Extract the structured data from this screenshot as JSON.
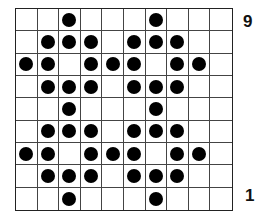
{
  "board": {
    "rows": 9,
    "cols": 10,
    "grid": [
      [
        0,
        0,
        1,
        0,
        0,
        0,
        1,
        0,
        0,
        0
      ],
      [
        0,
        1,
        1,
        1,
        0,
        1,
        1,
        1,
        0,
        0
      ],
      [
        1,
        1,
        0,
        1,
        1,
        1,
        0,
        1,
        1,
        0
      ],
      [
        0,
        1,
        1,
        1,
        0,
        1,
        1,
        1,
        0,
        0
      ],
      [
        0,
        0,
        1,
        0,
        0,
        0,
        1,
        0,
        0,
        0
      ],
      [
        0,
        1,
        1,
        1,
        0,
        1,
        1,
        1,
        0,
        0
      ],
      [
        1,
        1,
        0,
        1,
        1,
        1,
        0,
        1,
        1,
        0
      ],
      [
        0,
        1,
        1,
        1,
        0,
        1,
        1,
        1,
        0,
        0
      ],
      [
        0,
        0,
        1,
        0,
        0,
        0,
        1,
        0,
        0,
        0
      ]
    ],
    "dot_color": "#000000",
    "line_color": "#444444"
  },
  "labels": {
    "top_row": "9",
    "bottom_row": "1"
  }
}
